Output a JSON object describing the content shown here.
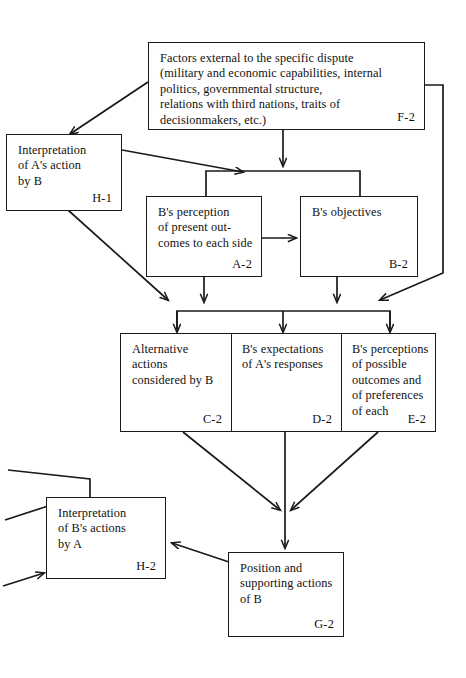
{
  "diagram": {
    "nodes": [
      {
        "id": "F-2",
        "name": "external-factors-box",
        "text": "Factors external to the specific dispute (military and economic capabilities, internal politics, governmental structure, relations with third nations, traits of decisionmakers, etc.)",
        "lines": [
          "Factors external to the specific dispute",
          "(military and economic capabilities, internal",
          "politics, governmental structure,",
          "relations with third nations, traits of",
          "decisionmakers, etc.)"
        ],
        "tag": "F-2"
      },
      {
        "id": "H-1",
        "name": "interpretation-of-a-action-by-b-box",
        "text": "Interpretation of A's action by B",
        "lines": [
          "Interpretation",
          "of A's action",
          "by B"
        ],
        "tag": "H-1"
      },
      {
        "id": "A-2",
        "name": "b-perception-of-present-outcomes-box",
        "text": "B's perception of present outcomes to each side",
        "lines": [
          "B's perception",
          "of present out-",
          "comes to each side"
        ],
        "tag": "A-2"
      },
      {
        "id": "B-2",
        "name": "b-objectives-box",
        "text": "B's objectives",
        "lines": [
          "B's objectives"
        ],
        "tag": "B-2"
      },
      {
        "id": "C-2",
        "name": "alternative-actions-considered-by-b-cell",
        "text": "Alternative actions considered by B",
        "lines": [
          "Alternative",
          "actions",
          "considered by B"
        ],
        "tag": "C-2"
      },
      {
        "id": "D-2",
        "name": "b-expectations-of-a-responses-cell",
        "text": "B's expectations of A's responses",
        "lines": [
          "B's expectations",
          "of A's responses"
        ],
        "tag": "D-2"
      },
      {
        "id": "E-2",
        "name": "b-perceptions-of-possible-outcomes-cell",
        "text": "B's perceptions of possible outcomes and of preferences of each",
        "lines": [
          "B's perceptions",
          "of possible",
          "outcomes and",
          "of preferences",
          "of each"
        ],
        "tag": "E-2"
      },
      {
        "id": "H-2",
        "name": "interpretation-of-b-actions-by-a-box",
        "text": "Interpretation of B's actions by A",
        "lines": [
          "Interpretation",
          "of B's actions",
          "by A"
        ],
        "tag": "H-2"
      },
      {
        "id": "G-2",
        "name": "position-and-supporting-actions-of-b-box",
        "text": "Position and supporting actions of B",
        "lines": [
          "Position and",
          "supporting actions",
          "of B"
        ],
        "tag": "G-2"
      }
    ],
    "colors": {
      "stroke": "#1a1a1a",
      "background": "#ffffff",
      "text": "#111111"
    }
  }
}
